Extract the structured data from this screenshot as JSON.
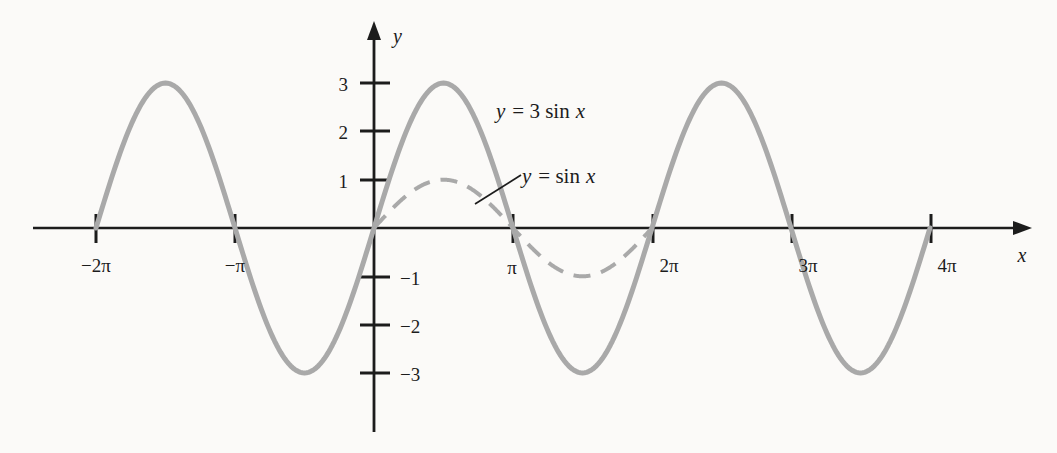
{
  "figure": {
    "background_color": "#fbfaf8",
    "axis_color": "#1c1c1c",
    "curve_color": "#a9a9a9",
    "x_axis_name": "x",
    "y_axis_name": "y"
  },
  "chart_data": {
    "type": "line",
    "title": "",
    "xlabel": "x",
    "ylabel": "y",
    "xlim": [
      -7.4,
      13.6
    ],
    "ylim": [
      -4.2,
      3.9
    ],
    "grid": false,
    "legend_position": "inline-annotations",
    "x_ticks": [
      {
        "value": -6.2832,
        "label": "−2π"
      },
      {
        "value": -3.1416,
        "label": "−π"
      },
      {
        "value": 3.1416,
        "label": "π"
      },
      {
        "value": 6.2832,
        "label": "2π"
      },
      {
        "value": 9.4248,
        "label": "3π"
      },
      {
        "value": 12.5664,
        "label": "4π"
      }
    ],
    "y_ticks": [
      {
        "value": 3,
        "label": "3"
      },
      {
        "value": 2,
        "label": "2"
      },
      {
        "value": 1,
        "label": "1"
      },
      {
        "value": -1,
        "label": "−1"
      },
      {
        "value": -2,
        "label": "−2"
      },
      {
        "value": -3,
        "label": "−3"
      }
    ],
    "series": [
      {
        "name": "y = 3 sin x",
        "formula": "3*sin(x)",
        "amplitude": 3,
        "period": 6.2832,
        "style": "solid",
        "color": "#a9a9a9",
        "linewidth": 5,
        "x_start": -6.2832,
        "x_end": 12.5664,
        "annotation": "y = 3 sin x",
        "key_points": [
          {
            "x": -6.2832,
            "y": 0
          },
          {
            "x": -4.7124,
            "y": 3
          },
          {
            "x": -3.1416,
            "y": 0
          },
          {
            "x": -1.5708,
            "y": -3
          },
          {
            "x": 0,
            "y": 0
          },
          {
            "x": 1.5708,
            "y": 3
          },
          {
            "x": 3.1416,
            "y": 0
          },
          {
            "x": 4.7124,
            "y": -3
          },
          {
            "x": 6.2832,
            "y": 0
          },
          {
            "x": 7.854,
            "y": 3
          },
          {
            "x": 9.4248,
            "y": 0
          },
          {
            "x": 10.9956,
            "y": -3
          },
          {
            "x": 12.5664,
            "y": 0
          }
        ]
      },
      {
        "name": "y = sin x",
        "formula": "sin(x)",
        "amplitude": 1,
        "period": 6.2832,
        "style": "dashed",
        "color": "#a9a9a9",
        "linewidth": 4,
        "x_start": 0,
        "x_end": 6.2832,
        "annotation": "y = sin x",
        "key_points": [
          {
            "x": 0,
            "y": 0
          },
          {
            "x": 1.5708,
            "y": 1
          },
          {
            "x": 3.1416,
            "y": 0
          },
          {
            "x": 4.7124,
            "y": -1
          },
          {
            "x": 6.2832,
            "y": 0
          }
        ]
      }
    ],
    "annotations": [
      {
        "text": "y = 3 sin x",
        "target_series": "y = 3 sin x",
        "leader": false
      },
      {
        "text": "y = sin x",
        "target_series": "y = sin x",
        "leader": true
      }
    ]
  },
  "labels": {
    "series_1_eq_y": "y",
    "series_1_eq_rest": "= 3 sin",
    "series_1_eq_x": "x",
    "series_2_eq_y": "y",
    "series_2_eq_rest": "= sin",
    "series_2_eq_x": "x",
    "x_tick_neg2pi": "−2π",
    "x_tick_negpi": "−π",
    "x_tick_pi": "π",
    "x_tick_2pi": "2π",
    "x_tick_3pi": "3π",
    "x_tick_4pi": "4π",
    "y_tick_3": "3",
    "y_tick_2": "2",
    "y_tick_1": "1",
    "y_tick_n1": "−1",
    "y_tick_n2": "−2",
    "y_tick_n3": "−3",
    "axis_x": "x",
    "axis_y": "y"
  }
}
